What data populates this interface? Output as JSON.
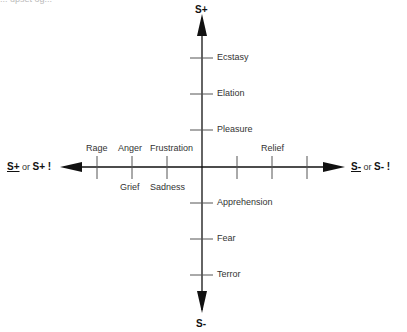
{
  "cut_off_header": "... upset og...",
  "axes": {
    "top": "S+",
    "bottom": "S-",
    "left": {
      "underlined": "S+",
      "or": "or",
      "bang": "S+ !"
    },
    "right": {
      "underlined": "S-",
      "or": "or",
      "bang": "S- !"
    }
  },
  "upper_labels": [
    "Ecstasy",
    "Elation",
    "Pleasure"
  ],
  "lower_labels": [
    "Apprehension",
    "Fear",
    "Terror"
  ],
  "left_above": [
    "Rage",
    "Anger",
    "Frustration"
  ],
  "left_below": [
    "Grief",
    "Sadness"
  ],
  "right_above": [
    "Relief"
  ]
}
